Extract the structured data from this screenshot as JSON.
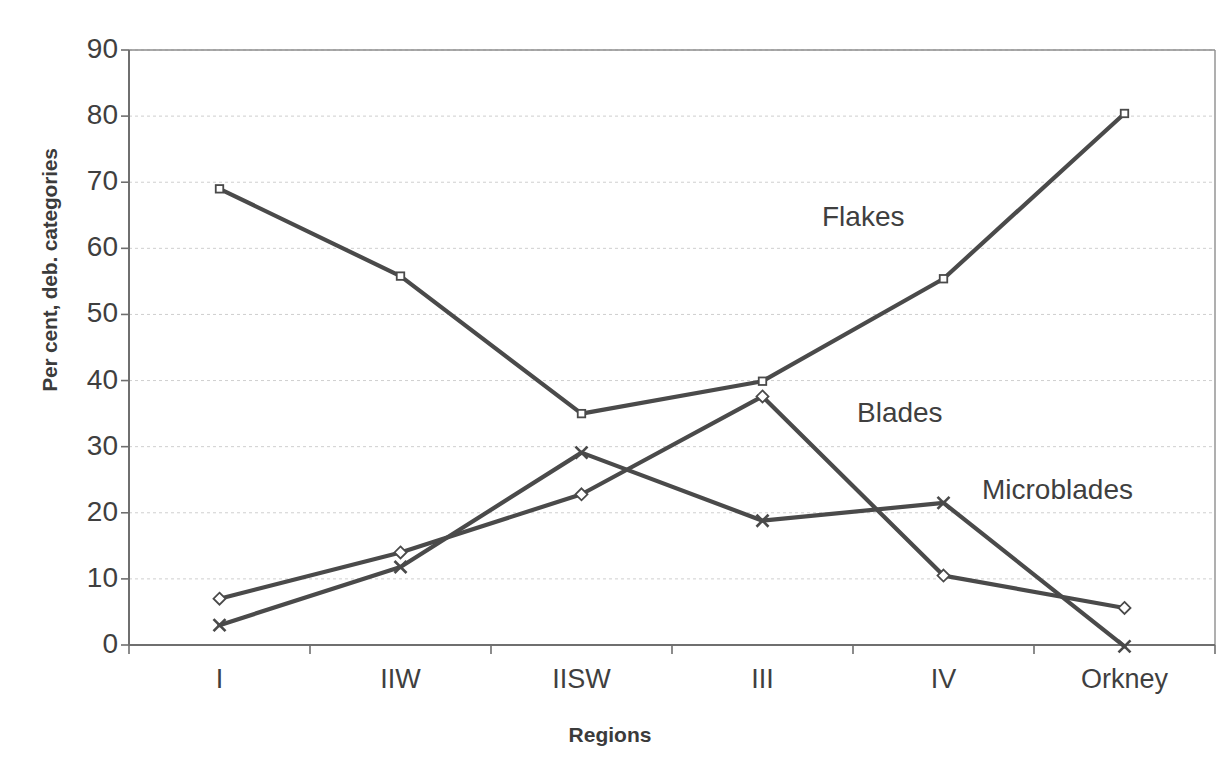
{
  "chart_data": {
    "type": "line",
    "title": "",
    "xlabel": "Regions",
    "ylabel": "Per cent, deb. categories",
    "categories": [
      "I",
      "IIW",
      "IISW",
      "III",
      "IV",
      "Orkney"
    ],
    "ylim": [
      0,
      90
    ],
    "yticks": [
      0,
      10,
      20,
      30,
      40,
      50,
      60,
      70,
      80,
      90
    ],
    "ytick_labels": [
      "0",
      "10",
      "20",
      "30",
      "40",
      "50",
      "60",
      "70",
      "80",
      "90"
    ],
    "grid": true,
    "grid_axis": "y",
    "legend_position": "inline-annotations",
    "series": [
      {
        "name": "Flakes",
        "marker": "square",
        "color": "#4a4a4a",
        "values": [
          69.0,
          55.8,
          35.0,
          39.9,
          55.4,
          80.4
        ],
        "annotation": {
          "text": "Flakes",
          "x_px": 822,
          "y_px": 202
        }
      },
      {
        "name": "Blades",
        "marker": "diamond",
        "color": "#4a4a4a",
        "values": [
          7.0,
          14.0,
          22.8,
          37.6,
          10.5,
          5.6
        ],
        "annotation": {
          "text": "Blades",
          "x_px": 857,
          "y_px": 398
        }
      },
      {
        "name": "Microblades",
        "marker": "x",
        "color": "#4a4a4a",
        "values": [
          3.0,
          11.8,
          29.1,
          18.8,
          21.5,
          -0.2
        ],
        "annotation": {
          "text": "Microblades",
          "x_px": 982,
          "y_px": 475
        }
      }
    ]
  },
  "axes": {
    "y_title": "Per cent, deb. categories",
    "x_title": "Regions",
    "y_labels": [
      "90",
      "80",
      "70",
      "60",
      "50",
      "40",
      "30",
      "20",
      "10",
      "0"
    ],
    "x_labels": [
      "I",
      "IIW",
      "IISW",
      "III",
      "IV",
      "Orkney"
    ]
  },
  "annotations": {
    "flakes": "Flakes",
    "blades": "Blades",
    "microblades": "Microblades"
  },
  "colors": {
    "line": "#4a4a4a",
    "axis": "#8d8d8d",
    "grid": "#cfcfcf",
    "text": "#3f3f3f",
    "background": "#ffffff"
  }
}
